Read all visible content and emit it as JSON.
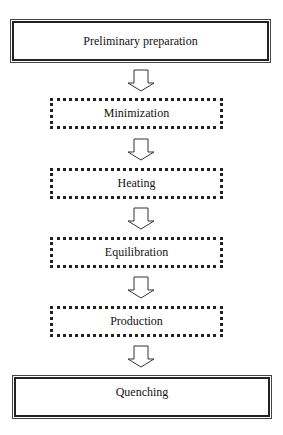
{
  "flowchart": {
    "steps": [
      {
        "label": "Preliminary preparation",
        "style": "solid"
      },
      {
        "label": "Minimization",
        "style": "dotted"
      },
      {
        "label": "Heating",
        "style": "dotted"
      },
      {
        "label": "Equilibration",
        "style": "dotted"
      },
      {
        "label": "Production",
        "style": "dotted"
      },
      {
        "label": "Quenching",
        "style": "solid"
      }
    ],
    "arrow_icon": "down-arrow-icon",
    "colors": {
      "line": "#222222",
      "background": "#ffffff"
    }
  }
}
